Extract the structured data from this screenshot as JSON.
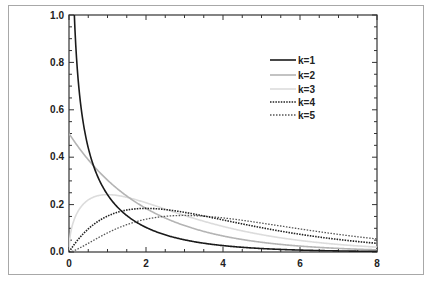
{
  "chart_data": {
    "type": "line",
    "title": "",
    "xlabel": "",
    "ylabel": "",
    "xlim": [
      0,
      8
    ],
    "ylim": [
      0,
      1.0
    ],
    "x_ticks": [
      "0",
      "2",
      "4",
      "6",
      "8"
    ],
    "y_ticks": [
      "0.0",
      "0.2",
      "0.4",
      "0.6",
      "0.8",
      "1.0"
    ],
    "grid": false,
    "legend_position": "upper right",
    "x": [
      0.05,
      0.1,
      0.2,
      0.3,
      0.5,
      0.75,
      1.0,
      1.5,
      2.0,
      2.5,
      3.0,
      4.0,
      5.0,
      6.0,
      7.0,
      8.0
    ],
    "series": [
      {
        "name": "k=1",
        "style": "solid-black",
        "values": [
          1.7603,
          1.2001,
          0.807,
          0.6276,
          0.4394,
          0.322,
          0.242,
          0.1542,
          0.1038,
          0.0716,
          0.0514,
          0.027,
          0.0146,
          0.0081,
          0.0046,
          0.0027
        ]
      },
      {
        "name": "k=2",
        "style": "solid-gray",
        "values": [
          0.4877,
          0.4756,
          0.4524,
          0.4304,
          0.3894,
          0.3437,
          0.3033,
          0.2362,
          0.1839,
          0.1433,
          0.1116,
          0.0677,
          0.041,
          0.0249,
          0.0151,
          0.0092
        ]
      },
      {
        "name": "k=3",
        "style": "solid-lightgray",
        "values": [
          0.0871,
          0.12,
          0.1614,
          0.1883,
          0.2197,
          0.2415,
          0.242,
          0.2313,
          0.2076,
          0.1789,
          0.1542,
          0.108,
          0.0732,
          0.0487,
          0.0319,
          0.0206
        ]
      },
      {
        "name": "k=4",
        "style": "dotted-dark",
        "values": [
          0.0122,
          0.0238,
          0.0452,
          0.0646,
          0.0974,
          0.1289,
          0.1516,
          0.1771,
          0.1839,
          0.1791,
          0.1673,
          0.1353,
          0.1026,
          0.0747,
          0.0528,
          0.0366
        ]
      },
      {
        "name": "k=5",
        "style": "dotted-gray",
        "values": [
          0.0029,
          0.008,
          0.0215,
          0.0377,
          0.0732,
          0.1208,
          0.1613,
          0.2313,
          0.2076,
          0.1491,
          0.1542,
          0.144,
          0.122,
          0.0974,
          0.0744,
          0.055
        ]
      }
    ]
  },
  "legend": {
    "items": [
      {
        "label": "k=1"
      },
      {
        "label": "k=2"
      },
      {
        "label": "k=3"
      },
      {
        "label": "k=4"
      },
      {
        "label": "k=5"
      }
    ]
  },
  "colors": {
    "k1": "#1a1a1a",
    "k2": "#b4b4b4",
    "k3": "#dcdcdc",
    "k4": "#2a2a2a",
    "k5": "#555555",
    "axis": "#333333",
    "frame": "#a8a8a8"
  }
}
